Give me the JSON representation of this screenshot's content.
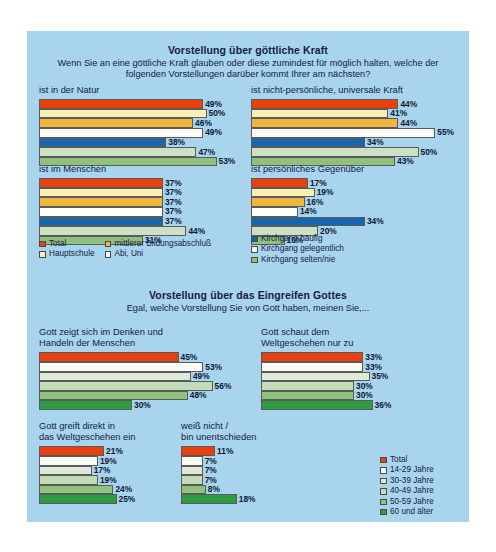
{
  "poster": {
    "background_color": "#a8d4ee"
  },
  "sections": [
    {
      "id": "goettliche-kraft",
      "title": "Vorstellung über göttliche Kraft",
      "subtitle": "Wenn Sie an eine göttliche Kraft glauben oder diese zumindest für möglich halten, welche der folgenden Vorstellungen darüber kommt Ihrer am nächsten?",
      "series_colors": [
        "#e8400f",
        "#f7efb4",
        "#f0b63e",
        "#fdfdfa",
        "#1767b0",
        "#cde0c4",
        "#8fc07d"
      ],
      "legend": {
        "col1": [
          "Total",
          "Hauptschule"
        ],
        "col2": [
          "mittlerer Bildungsabschluß",
          "Abi, Uni"
        ],
        "col3": [
          "Kirchgang häufig",
          "Kirchgang gelegentlich",
          "Kirchgang selten/nie"
        ],
        "col1_colors": [
          "#e8400f",
          "#f7efb4"
        ],
        "col2_colors": [
          "#f0b63e",
          "#fdfdfa"
        ],
        "col3_colors": [
          "#1767b0",
          "#eef4ea",
          "#8fc07d"
        ]
      },
      "charts": [
        {
          "title": "ist in der Natur",
          "values": [
            49,
            50,
            46,
            49,
            38,
            47,
            53
          ],
          "labels": [
            "49%",
            "50%",
            "46%",
            "49%",
            "38%",
            "47%",
            "53%"
          ]
        },
        {
          "title": "ist nicht-persönliche, universale Kraft",
          "values": [
            44,
            41,
            44,
            55,
            34,
            50,
            43
          ],
          "labels": [
            "44%",
            "41%",
            "44%",
            "55%",
            "34%",
            "50%",
            "43%"
          ]
        },
        {
          "title": "ist im Menschen",
          "values": [
            37,
            37,
            37,
            37,
            37,
            44,
            31
          ],
          "labels": [
            "37%",
            "37%",
            "37%",
            "37%",
            "37%",
            "44%",
            "31%"
          ]
        },
        {
          "title": "ist persönliches Gegenüber",
          "values": [
            17,
            19,
            16,
            14,
            34,
            20,
            10
          ],
          "labels": [
            "17%",
            "19%",
            "16%",
            "14%",
            "34%",
            "20%",
            "10%"
          ]
        }
      ]
    },
    {
      "id": "eingreifen-gottes",
      "title": "Vorstellung über das Eingreifen Gottes",
      "subtitle": "Egal, welche Vorstellung Sie von Gott haben, meinen Sie,...",
      "series_colors": [
        "#e8400f",
        "#fbfbf6",
        "#dfeada",
        "#c3dcb8",
        "#90c37e",
        "#2f9b45"
      ],
      "legend": {
        "items": [
          "Total",
          "14-29 Jahre",
          "30-39 Jahre",
          "40-49 Jahre",
          "50-59 Jahre",
          "60 und älter"
        ],
        "colors": [
          "#e8400f",
          "#fbfbf6",
          "#dfeada",
          "#c3dcb8",
          "#90c37e",
          "#2f9b45"
        ]
      },
      "charts": [
        {
          "title": "Gott zeigt sich im Denken und\nHandeln der Menschen",
          "values": [
            45,
            53,
            49,
            56,
            48,
            30
          ],
          "labels": [
            "45%",
            "53%",
            "49%",
            "56%",
            "48%",
            "30%"
          ]
        },
        {
          "title": "Gott schaut dem\nWeltgeschehen nur zu",
          "values": [
            33,
            33,
            35,
            30,
            30,
            36
          ],
          "labels": [
            "33%",
            "33%",
            "35%",
            "30%",
            "30%",
            "36%"
          ]
        },
        {
          "title": "Gott greift direkt in\ndas Weltgeschehen ein",
          "values": [
            21,
            19,
            17,
            19,
            24,
            25
          ],
          "labels": [
            "21%",
            "19%",
            "17%",
            "19%",
            "24%",
            "25%"
          ]
        },
        {
          "title": "weiß nicht /\nbin unentschieden",
          "values": [
            11,
            7,
            7,
            7,
            8,
            18
          ],
          "labels": [
            "11%",
            "7%",
            "7%",
            "7%",
            "8%",
            "18%"
          ]
        }
      ]
    }
  ],
  "chart_data": {
    "type": "bar",
    "orientation": "horizontal",
    "unit": "%",
    "grid": false,
    "xlim": [
      0,
      60
    ],
    "panels": [
      {
        "group": "Vorstellung über göttliche Kraft",
        "categories": [
          "Total",
          "Hauptschule",
          "mittlerer Bildungsabschluß",
          "Abi, Uni",
          "Kirchgang häufig",
          "Kirchgang gelegentlich",
          "Kirchgang selten/nie"
        ],
        "series": [
          {
            "name": "ist in der Natur",
            "values": [
              49,
              50,
              46,
              49,
              38,
              47,
              53
            ]
          },
          {
            "name": "ist nicht-persönliche, universale Kraft",
            "values": [
              44,
              41,
              44,
              55,
              34,
              50,
              43
            ]
          },
          {
            "name": "ist im Menschen",
            "values": [
              37,
              37,
              37,
              37,
              37,
              44,
              31
            ]
          },
          {
            "name": "ist persönliches Gegenüber",
            "values": [
              17,
              19,
              16,
              14,
              34,
              20,
              10
            ]
          }
        ]
      },
      {
        "group": "Vorstellung über das Eingreifen Gottes",
        "categories": [
          "Total",
          "14-29 Jahre",
          "30-39 Jahre",
          "40-49 Jahre",
          "50-59 Jahre",
          "60 und älter"
        ],
        "series": [
          {
            "name": "Gott zeigt sich im Denken und Handeln der Menschen",
            "values": [
              45,
              53,
              49,
              56,
              48,
              30
            ]
          },
          {
            "name": "Gott schaut dem Weltgeschehen nur zu",
            "values": [
              33,
              33,
              35,
              30,
              30,
              36
            ]
          },
          {
            "name": "Gott greift direkt in das Weltgeschehen ein",
            "values": [
              21,
              19,
              17,
              19,
              24,
              25
            ]
          },
          {
            "name": "weiß nicht / bin unentschieden",
            "values": [
              11,
              7,
              7,
              7,
              8,
              18
            ]
          }
        ]
      }
    ]
  }
}
